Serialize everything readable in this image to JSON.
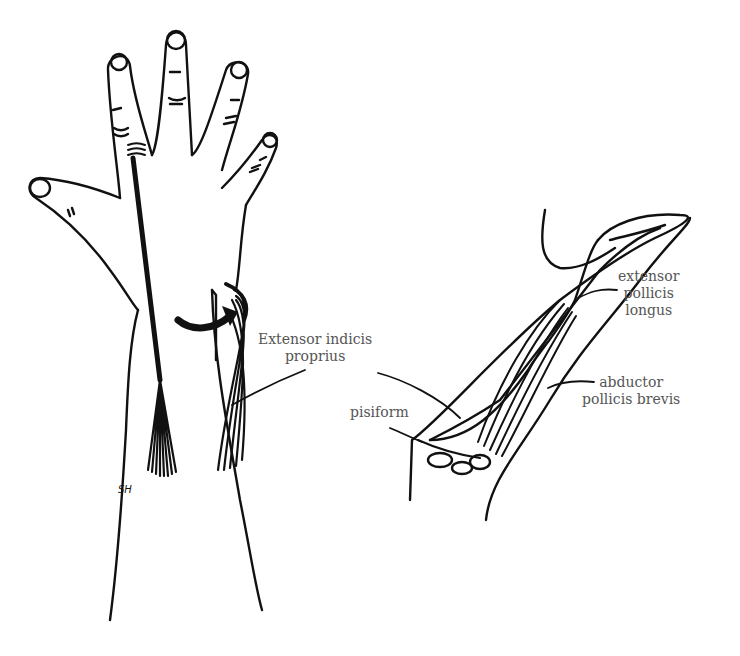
{
  "figure": {
    "labels": {
      "extensor_indicis": [
        "Extensor indicis",
        "proprius"
      ],
      "extensor_pollicis": [
        "extensor",
        "pollicis",
        "longus"
      ],
      "abductor_pollicis": [
        "abductor",
        "pollicis brevis"
      ],
      "pisiform": "pisiform"
    },
    "signature": "SH",
    "colors": {
      "line": "#111111",
      "label": "#555555",
      "background": "#ffffff"
    }
  }
}
